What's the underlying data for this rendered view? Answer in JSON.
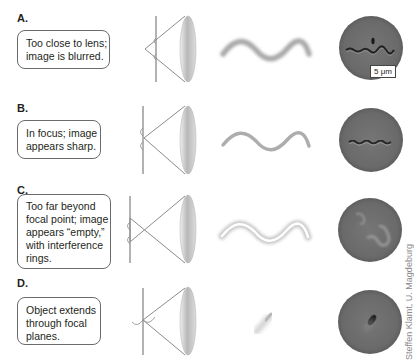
{
  "figure": {
    "panels": [
      {
        "label": "A.",
        "description_lines": [
          "Too close to lens;",
          "image is blurred."
        ],
        "condition": "too-close",
        "appearance": "blurred"
      },
      {
        "label": "B.",
        "description_lines": [
          "In focus; image",
          "appears sharp."
        ],
        "condition": "in-focus",
        "appearance": "sharp"
      },
      {
        "label": "C.",
        "description_lines": [
          "Too far beyond",
          "focal point; image",
          "appears “empty,”",
          "with interference",
          "rings."
        ],
        "condition": "too-far",
        "appearance": "empty-with-rings"
      },
      {
        "label": "D.",
        "description_lines": [
          "Object extends",
          "through focal",
          "planes."
        ],
        "condition": "extends-through-planes",
        "appearance": "partial"
      }
    ],
    "scale_bar": "5 μm",
    "credit": "Steffen Klamt, U. Magdeburg",
    "colors": {
      "wave": "#a9a9a9",
      "micrograph_bg": "#6e6e6e",
      "lens_line": "#8c8c8c",
      "box_border": "#6b6b6b"
    }
  }
}
